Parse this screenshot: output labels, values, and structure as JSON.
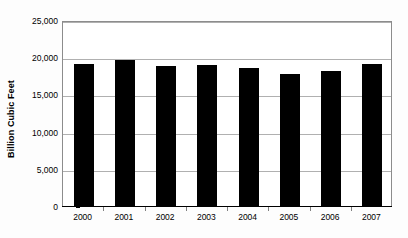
{
  "chart_data": {
    "type": "bar",
    "title": "",
    "subtitle": "",
    "xlabel": "",
    "ylabel": "Billion Cubic Feet",
    "categories": [
      "2000",
      "2001",
      "2002",
      "2003",
      "2004",
      "2005",
      "2006",
      "2007"
    ],
    "values": [
      19050,
      19600,
      18800,
      18900,
      18500,
      17800,
      18200,
      19050
    ],
    "ylim": [
      0,
      25000
    ],
    "yticks": [
      0,
      5000,
      10000,
      15000,
      20000,
      25000
    ],
    "ytick_labels": [
      "0",
      "5,000",
      "10,000",
      "15,000",
      "20,000",
      "25,000"
    ],
    "grid": true,
    "legend": null,
    "legend_position": "none",
    "series": [
      {
        "name": "Billion Cubic Feet",
        "values": [
          19050,
          19600,
          18800,
          18900,
          18500,
          17800,
          18200,
          19050
        ],
        "color": "#000000"
      }
    ],
    "annotations": []
  },
  "colors": {
    "bar": "#000000",
    "gridline": "#b0b0b0",
    "plot_border": "#8c8c8c",
    "axis": "#000000",
    "plot_background": "#ffffff",
    "page_background": "#fdfdfd"
  }
}
